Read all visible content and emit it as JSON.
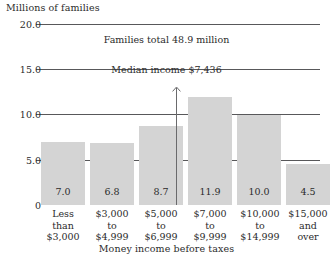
{
  "chart_data": {
    "type": "bar",
    "title": "Families total 48.9 million",
    "ylabel": "Millions of families",
    "xlabel": "Money income before taxes",
    "ylim": [
      0,
      20
    ],
    "yticks": [
      "0",
      "5.0",
      "10.0",
      "15.0",
      "20.0"
    ],
    "ytick_values": [
      0,
      5,
      10,
      15,
      20
    ],
    "grid": true,
    "legend": "none",
    "categories": [
      "Less\nthan\n$3,000",
      "$3,000\nto\n$4,999",
      "$5,000\nto\n$6,999",
      "$7,000\nto\n$9,999",
      "$10,000\nto\n$14,999",
      "$15,000\nand\nover"
    ],
    "category_lines": [
      [
        "Less",
        "than",
        "$3,000"
      ],
      [
        "$3,000",
        "to",
        "$4,999"
      ],
      [
        "$5,000",
        "to",
        "$6,999"
      ],
      [
        "$7,000",
        "to",
        "$9,999"
      ],
      [
        "$10,000",
        "to",
        "$14,999"
      ],
      [
        "$15,000",
        "and",
        "over"
      ]
    ],
    "values": [
      7.0,
      6.8,
      8.7,
      11.9,
      10.0,
      4.5
    ],
    "value_labels": [
      "7.0",
      "6.8",
      "8.7",
      "11.9",
      "10.0",
      "4.5"
    ],
    "annotations": [
      {
        "name": "median-income",
        "text": "Median income $7,436",
        "value": 7436,
        "at_category_index": 3,
        "style": "vertical-line-with-up-arrow"
      }
    ],
    "colors": {
      "bar_fill": "#d4d4d4",
      "gridline": "#58585a",
      "text": "#2b2b2b",
      "background": "#ffffff",
      "median_line": "#6a6a6c"
    }
  }
}
